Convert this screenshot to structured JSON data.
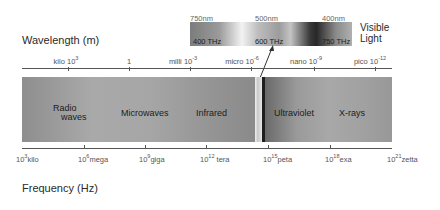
{
  "wavelength_axis": {
    "title": "Wavelength (m)",
    "ticks": [
      {
        "prefix": "kilo",
        "base": "10",
        "exp": "3"
      },
      {
        "prefix": "",
        "base": "1",
        "exp": ""
      },
      {
        "prefix": "milli",
        "base": "10",
        "exp": "-3"
      },
      {
        "prefix": "micro",
        "base": "10",
        "exp": "-6"
      },
      {
        "prefix": "nano",
        "base": "10",
        "exp": "-9"
      },
      {
        "prefix": "pico",
        "base": "10",
        "exp": "-12"
      }
    ]
  },
  "frequency_axis": {
    "title": "Frequency (Hz)",
    "ticks": [
      {
        "base": "10",
        "exp": "3",
        "prefix": "kilo"
      },
      {
        "base": "10",
        "exp": "6",
        "prefix": "mega"
      },
      {
        "base": "10",
        "exp": "9",
        "prefix": "giga"
      },
      {
        "base": "10",
        "exp": "12",
        "prefix": "tera"
      },
      {
        "base": "10",
        "exp": "15",
        "prefix": "peta"
      },
      {
        "base": "10",
        "exp": "18",
        "prefix": "exa"
      },
      {
        "base": "10",
        "exp": "21",
        "prefix": "zetta"
      }
    ]
  },
  "regions": {
    "radio_line1": "Radio",
    "radio_line2": "waves",
    "microwaves": "Microwaves",
    "infrared": "Infrared",
    "ultraviolet": "Ultraviolet",
    "xrays": "X-rays"
  },
  "visible_light": {
    "title_line1": "Visible",
    "title_line2": "Light",
    "wavelengths": [
      "750nm",
      "500nm",
      "400nm"
    ],
    "frequencies": [
      "400 THz",
      "600 THz",
      "750 THz"
    ]
  }
}
